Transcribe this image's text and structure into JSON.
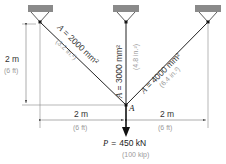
{
  "figure": {
    "supports": [
      {
        "id": "left",
        "x": 40
      },
      {
        "id": "middle",
        "x": 126
      },
      {
        "id": "right",
        "x": 208
      }
    ],
    "members": [
      {
        "id": "left-bar",
        "area_label": "A = 2000 mm²",
        "area_imperial": "(3.2 in.²)"
      },
      {
        "id": "middle-bar",
        "area_label": "A = 3000 mm²",
        "area_imperial": "(4.8 in.²)"
      },
      {
        "id": "right-bar",
        "area_label": "A = 4000 mm²",
        "area_imperial": "(6.4 in.²)"
      }
    ],
    "joint_label": "A",
    "dimensions": {
      "vertical": {
        "metric": "2 m",
        "imperial": "(6 ft)"
      },
      "horizontal_left": {
        "metric": "2 m",
        "imperial": "(6 ft)"
      },
      "horizontal_right": {
        "metric": "2 m",
        "imperial": "(6 ft)"
      }
    },
    "load": {
      "symbol": "P",
      "equals": "=",
      "value": "450 kN",
      "imperial": "(100 kip)"
    },
    "colors": {
      "line": "#222222",
      "support_fill": "#8a8a8a",
      "secondary_text": "#9a9a9a",
      "dim_line": "#777777"
    }
  }
}
